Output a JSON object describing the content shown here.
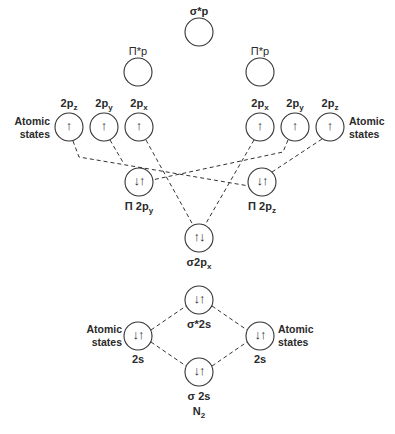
{
  "diagram": {
    "title": "N2",
    "title_main": "N",
    "title_sub": "2",
    "side_label_line1": "Atomic",
    "side_label_line2": "states",
    "orbitals": {
      "sigma_star_p": {
        "label": "σ*p",
        "electrons": ""
      },
      "pi_star_p_left": {
        "label": "Π*p",
        "electrons": ""
      },
      "pi_star_p_right": {
        "label": "Π*p",
        "electrons": ""
      },
      "left_2pz": {
        "label_main": "2p",
        "label_sub": "z",
        "electrons": "↑"
      },
      "left_2py": {
        "label_main": "2p",
        "label_sub": "y",
        "electrons": "↑"
      },
      "left_2px": {
        "label_main": "2p",
        "label_sub": "x",
        "electrons": "↑"
      },
      "right_2px": {
        "label_main": "2p",
        "label_sub": "x",
        "electrons": "↑"
      },
      "right_2py": {
        "label_main": "2p",
        "label_sub": "y",
        "electrons": "↑"
      },
      "right_2pz": {
        "label_main": "2p",
        "label_sub": "z",
        "electrons": "↑"
      },
      "pi_2py": {
        "label_main": "Π 2p",
        "label_sub": "y",
        "electrons": "↓↑"
      },
      "pi_2pz": {
        "label_main": "Π 2p",
        "label_sub": "z",
        "electrons": "↓↑"
      },
      "sigma_2px": {
        "label_main": "σ2p",
        "label_sub": "x",
        "electrons": "↑↓"
      },
      "sigma_star_2s": {
        "label": "σ*2s",
        "electrons": "↓↑"
      },
      "left_2s": {
        "label": "2s",
        "electrons": "↓↑"
      },
      "right_2s": {
        "label": "2s",
        "electrons": "↓↑"
      },
      "sigma_2s": {
        "label": "σ 2s",
        "electrons": "↓↑"
      }
    }
  }
}
